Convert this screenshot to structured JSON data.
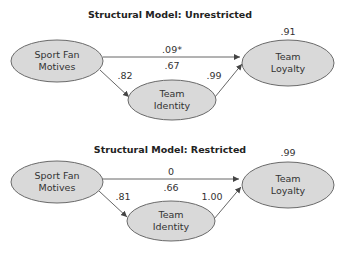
{
  "models": [
    {
      "title": "Structural Model: Unrestricted",
      "nodes": {
        "motives": {
          "line1": "Sport Fan",
          "line2": "Motives"
        },
        "identity": {
          "line1": "Team",
          "line2": "Identity"
        },
        "loyalty": {
          "line1": "Team",
          "line2": "Loyalty"
        }
      },
      "r2": {
        "identity": ".67",
        "loyalty": ".91"
      },
      "paths": {
        "motives_to_loyalty": ".09*",
        "motives_to_identity": ".82",
        "identity_to_loyalty": ".99"
      }
    },
    {
      "title": "Structural Model: Restricted",
      "nodes": {
        "motives": {
          "line1": "Sport Fan",
          "line2": "Motives"
        },
        "identity": {
          "line1": "Team",
          "line2": "Identity"
        },
        "loyalty": {
          "line1": "Team",
          "line2": "Loyalty"
        }
      },
      "r2": {
        "identity": ".66",
        "loyalty": ".99"
      },
      "paths": {
        "motives_to_loyalty": "0",
        "motives_to_identity": ".81",
        "identity_to_loyalty": "1.00"
      }
    }
  ],
  "colors": {
    "node_fill": "#d9d9d9",
    "node_stroke": "#6a6a6a",
    "edge": "#555555"
  }
}
